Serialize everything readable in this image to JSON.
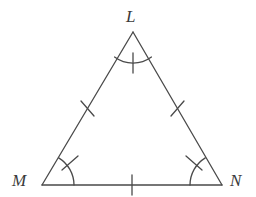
{
  "figure": {
    "kind": "geometry-diagram",
    "shape": "triangle",
    "stroke_color": "#4a4a4a",
    "background_color": "#ffffff",
    "stroke_width": 1.3
  },
  "vertices": [
    {
      "id": "L",
      "label": "L",
      "x": 133,
      "y": 32,
      "label_x": 126,
      "label_y": 8
    },
    {
      "id": "M",
      "label": "M",
      "x": 42,
      "y": 185,
      "label_x": 12,
      "label_y": 172
    },
    {
      "id": "N",
      "label": "N",
      "x": 222,
      "y": 185,
      "label_x": 230,
      "label_y": 172
    }
  ],
  "sides": [
    {
      "id": "LM",
      "from": "L",
      "to": "M",
      "tick_count": 1,
      "tick_label": "single-tick"
    },
    {
      "id": "LN",
      "from": "L",
      "to": "N",
      "tick_count": 1,
      "tick_label": "single-tick"
    },
    {
      "id": "MN",
      "from": "M",
      "to": "N",
      "tick_count": 1,
      "tick_label": "single-tick"
    }
  ],
  "angles": [
    {
      "id": "angle-L",
      "vertex": "L",
      "arc_count": 1,
      "tick_count": 1
    },
    {
      "id": "angle-M",
      "vertex": "M",
      "arc_count": 1,
      "tick_count": 1
    },
    {
      "id": "angle-N",
      "vertex": "N",
      "arc_count": 1,
      "tick_count": 1
    }
  ]
}
